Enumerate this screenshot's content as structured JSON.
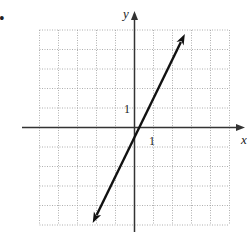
{
  "bullet": "•",
  "axes": {
    "x_label": "x",
    "y_label": "y",
    "x_tick_label": "1",
    "y_tick_label": "1"
  },
  "colors": {
    "grid": "#9a9a9a",
    "axis": "#333333",
    "line": "#111111",
    "background": "#ffffff"
  },
  "chart_data": {
    "type": "line",
    "title": "",
    "xlabel": "x",
    "ylabel": "y",
    "xlim": [
      -5,
      5
    ],
    "ylim": [
      -5,
      5
    ],
    "grid": true,
    "grid_style": "dotted",
    "tick_labels": {
      "x": [
        "1"
      ],
      "y": [
        "1"
      ]
    },
    "series": [
      {
        "name": "line",
        "equation": "y = 2x - 0.5",
        "x": [
          -2.2,
          2.65
        ],
        "y": [
          -4.9,
          4.8
        ],
        "arrows_both_ends": true
      }
    ],
    "legend": null
  }
}
